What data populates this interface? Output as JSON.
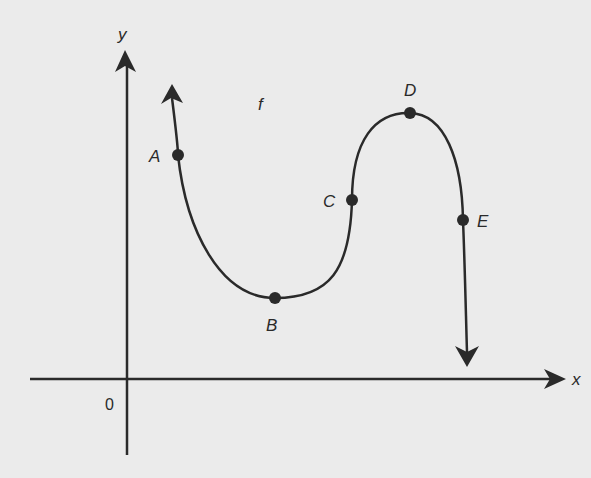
{
  "diagram": {
    "function_label": "f",
    "axes": {
      "x_label": "x",
      "y_label": "y",
      "origin_label": "0"
    },
    "points": [
      {
        "label": "A",
        "description": "on decreasing part near left end"
      },
      {
        "label": "B",
        "description": "local minimum"
      },
      {
        "label": "C",
        "description": "inflection point on rising part"
      },
      {
        "label": "D",
        "description": "local maximum"
      },
      {
        "label": "E",
        "description": "on decreasing part near right end"
      }
    ],
    "colors": {
      "ink": "#2a2a2a",
      "background": "#ebebeb"
    }
  }
}
